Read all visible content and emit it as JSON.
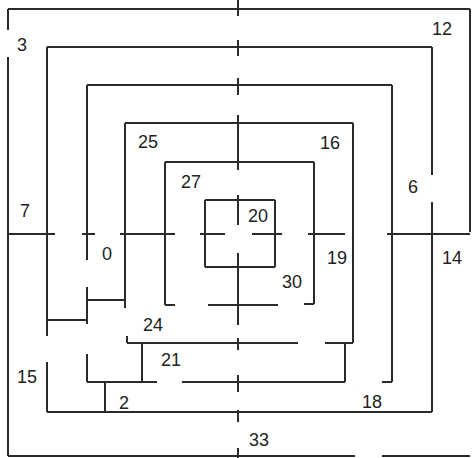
{
  "diagram": {
    "type": "maze",
    "stroke_color": "#2a2a2a",
    "background": "#ffffff",
    "region_labels": [
      {
        "id": "r3",
        "text": "3",
        "x": 22,
        "y": 45
      },
      {
        "id": "r12",
        "text": "12",
        "x": 442,
        "y": 29
      },
      {
        "id": "r25",
        "text": "25",
        "x": 148,
        "y": 142
      },
      {
        "id": "r16",
        "text": "16",
        "x": 330,
        "y": 143
      },
      {
        "id": "r27",
        "text": "27",
        "x": 191,
        "y": 182
      },
      {
        "id": "r6",
        "text": "6",
        "x": 413,
        "y": 187
      },
      {
        "id": "r7",
        "text": "7",
        "x": 25,
        "y": 211
      },
      {
        "id": "r20",
        "text": "20",
        "x": 258,
        "y": 216
      },
      {
        "id": "r0",
        "text": "0",
        "x": 107,
        "y": 254
      },
      {
        "id": "r19",
        "text": "19",
        "x": 337,
        "y": 258
      },
      {
        "id": "r14",
        "text": "14",
        "x": 452,
        "y": 258
      },
      {
        "id": "r30",
        "text": "30",
        "x": 292,
        "y": 282
      },
      {
        "id": "r24",
        "text": "24",
        "x": 153,
        "y": 325
      },
      {
        "id": "r21",
        "text": "21",
        "x": 171,
        "y": 360
      },
      {
        "id": "r15",
        "text": "15",
        "x": 27,
        "y": 377
      },
      {
        "id": "r2",
        "text": "2",
        "x": 124,
        "y": 403
      },
      {
        "id": "r18",
        "text": "18",
        "x": 372,
        "y": 402
      },
      {
        "id": "r33",
        "text": "33",
        "x": 259,
        "y": 440
      }
    ],
    "walls": [
      [
        8,
        9,
        470,
        9
      ],
      [
        8,
        9,
        8,
        30
      ],
      [
        8,
        57,
        8,
        456
      ],
      [
        8,
        456,
        355,
        456
      ],
      [
        382,
        456,
        470,
        456
      ],
      [
        470,
        9,
        470,
        232
      ],
      [
        47,
        47,
        432,
        47
      ],
      [
        432,
        47,
        432,
        175
      ],
      [
        432,
        202,
        432,
        412
      ],
      [
        47,
        47,
        47,
        336
      ],
      [
        47,
        412,
        432,
        412
      ],
      [
        47,
        362,
        47,
        412
      ],
      [
        87,
        85,
        392,
        85
      ],
      [
        392,
        85,
        392,
        382
      ],
      [
        382,
        382,
        392,
        382
      ],
      [
        87,
        85,
        87,
        260
      ],
      [
        87,
        287,
        87,
        324
      ],
      [
        47,
        320,
        87,
        320
      ],
      [
        125,
        123,
        353,
        123
      ],
      [
        353,
        123,
        353,
        343
      ],
      [
        125,
        123,
        125,
        308
      ],
      [
        87,
        300,
        125,
        300
      ],
      [
        182,
        382,
        345,
        382
      ],
      [
        87,
        354,
        87,
        382
      ],
      [
        87,
        382,
        157,
        382
      ],
      [
        105,
        382,
        105,
        412
      ],
      [
        165,
        162,
        314,
        162
      ],
      [
        314,
        162,
        314,
        304
      ],
      [
        304,
        304,
        314,
        304
      ],
      [
        165,
        162,
        165,
        305
      ],
      [
        165,
        305,
        175,
        305
      ],
      [
        208,
        305,
        278,
        305
      ],
      [
        205,
        200,
        275,
        200
      ],
      [
        275,
        200,
        275,
        267
      ],
      [
        205,
        200,
        205,
        267
      ],
      [
        205,
        267,
        275,
        267
      ],
      [
        127,
        343,
        298,
        343
      ],
      [
        325,
        343,
        353,
        343
      ],
      [
        345,
        343,
        345,
        382
      ],
      [
        127,
        336,
        127,
        343
      ],
      [
        142,
        343,
        142,
        382
      ],
      [
        8,
        234,
        55,
        234
      ],
      [
        82,
        234,
        95,
        234
      ],
      [
        120,
        234,
        175,
        234
      ],
      [
        200,
        234,
        225,
        234
      ],
      [
        252,
        234,
        282,
        234
      ],
      [
        308,
        234,
        345,
        234
      ],
      [
        387,
        234,
        470,
        234
      ],
      [
        238,
        0,
        238,
        16
      ],
      [
        238,
        40,
        238,
        56
      ],
      [
        238,
        78,
        238,
        95
      ],
      [
        238,
        115,
        238,
        170
      ],
      [
        238,
        195,
        238,
        225
      ],
      [
        238,
        253,
        238,
        325
      ],
      [
        238,
        338,
        238,
        350
      ],
      [
        238,
        375,
        238,
        392
      ],
      [
        238,
        410,
        238,
        422
      ],
      [
        238,
        448,
        238,
        458
      ]
    ]
  }
}
